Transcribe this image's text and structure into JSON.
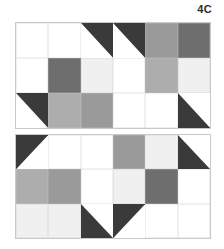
{
  "figure": {
    "label": "4C",
    "caption_position": "top-right"
  },
  "palette": {
    "white": "#ffffff",
    "very_light": "#f0f0f0",
    "light": "#c8c8c8",
    "light_mid": "#adadad",
    "mid": "#9a9a9a",
    "med_dark": "#6e6e6e",
    "dark": "#3a3a3a",
    "grid_line": "#c9c9c9",
    "page_background": "#ffffff"
  },
  "diagram": {
    "type": "quilt-block-layout",
    "block_count": 2,
    "grid_columns": 6,
    "grid_rows": 3,
    "blocks": [
      {
        "name": "block-top",
        "orientation": "upright",
        "cells": [
          {
            "id": "t-r1c1",
            "patch": "solid",
            "colors": [
              "white"
            ]
          },
          {
            "id": "t-r1c2",
            "patch": "solid",
            "colors": [
              "white"
            ]
          },
          {
            "id": "t-r1c3",
            "patch": "hst-bottom-left",
            "colors": [
              "white",
              "dark"
            ]
          },
          {
            "id": "t-r1c4",
            "patch": "hst-bottom-right",
            "colors": [
              "dark",
              "white"
            ]
          },
          {
            "id": "t-r1c5",
            "patch": "solid",
            "colors": [
              "mid"
            ]
          },
          {
            "id": "t-r1c6",
            "patch": "solid",
            "colors": [
              "med_dark"
            ]
          },
          {
            "id": "t-r2c1",
            "patch": "solid",
            "colors": [
              "white"
            ]
          },
          {
            "id": "t-r2c2",
            "patch": "solid",
            "colors": [
              "med_dark"
            ]
          },
          {
            "id": "t-r2c3",
            "patch": "solid",
            "colors": [
              "very_light"
            ]
          },
          {
            "id": "t-r2c4",
            "patch": "solid",
            "colors": [
              "white"
            ]
          },
          {
            "id": "t-r2c5",
            "patch": "solid",
            "colors": [
              "light_mid"
            ]
          },
          {
            "id": "t-r2c6",
            "patch": "solid",
            "colors": [
              "very_light"
            ]
          },
          {
            "id": "t-r3c1",
            "patch": "hst-bottom-left",
            "colors": [
              "white",
              "dark"
            ]
          },
          {
            "id": "t-r3c2",
            "patch": "solid",
            "colors": [
              "light_mid"
            ]
          },
          {
            "id": "t-r3c3",
            "patch": "solid",
            "colors": [
              "mid"
            ]
          },
          {
            "id": "t-r3c4",
            "patch": "solid",
            "colors": [
              "white"
            ]
          },
          {
            "id": "t-r3c5",
            "patch": "solid",
            "colors": [
              "white"
            ]
          },
          {
            "id": "t-r3c6",
            "patch": "hst-top-right",
            "colors": [
              "white",
              "dark"
            ]
          }
        ]
      },
      {
        "name": "block-bottom",
        "orientation": "vertical-mirror",
        "cells": [
          {
            "id": "b-r1c1",
            "patch": "hst-top-left",
            "colors": [
              "dark",
              "white"
            ]
          },
          {
            "id": "b-r1c2",
            "patch": "solid",
            "colors": [
              "white"
            ]
          },
          {
            "id": "b-r1c3",
            "patch": "solid",
            "colors": [
              "white"
            ]
          },
          {
            "id": "b-r1c4",
            "patch": "solid",
            "colors": [
              "mid"
            ]
          },
          {
            "id": "b-r1c5",
            "patch": "solid",
            "colors": [
              "very_light"
            ]
          },
          {
            "id": "b-r1c6",
            "patch": "hst-top-right",
            "colors": [
              "white",
              "dark"
            ]
          },
          {
            "id": "b-r2c1",
            "patch": "solid",
            "colors": [
              "light_mid"
            ]
          },
          {
            "id": "b-r2c2",
            "patch": "solid",
            "colors": [
              "mid"
            ]
          },
          {
            "id": "b-r2c3",
            "patch": "solid",
            "colors": [
              "white"
            ]
          },
          {
            "id": "b-r2c4",
            "patch": "solid",
            "colors": [
              "very_light"
            ]
          },
          {
            "id": "b-r2c5",
            "patch": "solid",
            "colors": [
              "med_dark"
            ]
          },
          {
            "id": "b-r2c6",
            "patch": "solid",
            "colors": [
              "white"
            ]
          },
          {
            "id": "b-r3c1",
            "patch": "solid",
            "colors": [
              "very_light"
            ]
          },
          {
            "id": "b-r3c2",
            "patch": "solid",
            "colors": [
              "very_light"
            ]
          },
          {
            "id": "b-r3c3",
            "patch": "hst-top-right",
            "colors": [
              "white",
              "dark"
            ]
          },
          {
            "id": "b-r3c4",
            "patch": "hst-top-left",
            "colors": [
              "dark",
              "white"
            ]
          },
          {
            "id": "b-r3c5",
            "patch": "solid",
            "colors": [
              "white"
            ]
          },
          {
            "id": "b-r3c6",
            "patch": "solid",
            "colors": [
              "white"
            ]
          }
        ]
      }
    ]
  }
}
